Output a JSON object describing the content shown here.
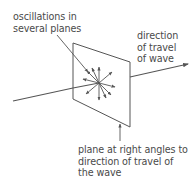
{
  "diagram": {
    "labels": {
      "oscillations": [
        "oscillations in",
        "several planes"
      ],
      "direction": [
        "direction",
        "of travel",
        "of wave"
      ],
      "plane": [
        "plane at right angles to",
        "direction of travel of",
        "the wave"
      ]
    },
    "colors": {
      "line": "#555555",
      "text": "#4a4a4a",
      "background": "#ffffff"
    }
  }
}
